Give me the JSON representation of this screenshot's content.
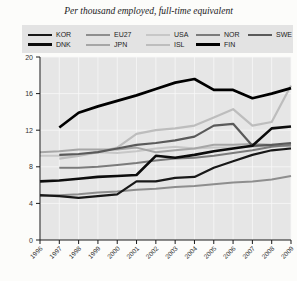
{
  "chart_data": {
    "type": "line",
    "title": "Per thousand employed, full-time equivalent",
    "xlabel": "",
    "ylabel": "",
    "x": [
      1996,
      1997,
      1998,
      1999,
      2000,
      2001,
      2002,
      2003,
      2004,
      2005,
      2006,
      2007,
      2008,
      2009
    ],
    "ylim": [
      0,
      20
    ],
    "yticks": [
      0,
      4,
      8,
      12,
      16,
      20
    ],
    "grid": true,
    "legend_position": "top",
    "legend_rows": [
      [
        "KOR",
        "EU27",
        "USA",
        "NOR",
        "SWE"
      ],
      [
        "DNK",
        "JPN",
        "ISL",
        "FIN"
      ]
    ],
    "colors": {
      "plot_background": "#e6e6e6",
      "legend_background": "#e3e3e3",
      "gridline": "#f7f7f7",
      "axis": "#1a1a1a"
    },
    "series": [
      {
        "name": "USA",
        "color": "#c7c7c7",
        "width": 2,
        "values": [
          9.2,
          9.2,
          9.3,
          9.6,
          9.5,
          9.7,
          10.0,
          10.2,
          10.0,
          10.1,
          10.1,
          10.2,
          10.3,
          10.4
        ]
      },
      {
        "name": "ISL",
        "color": "#bdbdbd",
        "width": 2.2,
        "values": [
          null,
          8.9,
          9.2,
          9.6,
          10.1,
          11.6,
          12.0,
          12.2,
          12.5,
          13.4,
          14.3,
          12.5,
          12.9,
          16.9
        ]
      },
      {
        "name": "JPN",
        "color": "#a6a6a6",
        "width": 2,
        "values": [
          9.6,
          9.7,
          9.9,
          9.9,
          9.9,
          10.1,
          9.6,
          9.8,
          10.0,
          10.4,
          10.4,
          10.5,
          10.4,
          10.2
        ]
      },
      {
        "name": "EU27",
        "color": "#8e8e8e",
        "width": 2,
        "values": [
          4.8,
          4.9,
          5.0,
          5.2,
          5.3,
          5.5,
          5.6,
          5.8,
          5.9,
          6.1,
          6.3,
          6.4,
          6.6,
          7.0
        ]
      },
      {
        "name": "NOR",
        "color": "#7b7b7b",
        "width": 2,
        "values": [
          null,
          7.9,
          7.9,
          8.0,
          8.2,
          8.4,
          8.7,
          8.9,
          9.0,
          9.2,
          9.5,
          9.8,
          10.2,
          10.4
        ]
      },
      {
        "name": "SWE",
        "color": "#5a5a5a",
        "width": 2.2,
        "values": [
          null,
          9.3,
          9.4,
          9.6,
          10.0,
          10.4,
          10.6,
          10.9,
          11.3,
          12.5,
          12.7,
          10.3,
          10.4,
          10.6
        ]
      },
      {
        "name": "KOR",
        "color": "#181818",
        "width": 2.2,
        "values": [
          4.9,
          4.8,
          4.6,
          4.8,
          5.0,
          6.4,
          6.4,
          6.8,
          6.9,
          7.9,
          8.6,
          9.3,
          9.8,
          10.0
        ]
      },
      {
        "name": "DNK",
        "color": "#0c0c0c",
        "width": 2.6,
        "values": [
          6.4,
          6.5,
          6.7,
          6.9,
          7.0,
          7.1,
          9.2,
          9.0,
          9.3,
          9.7,
          10.0,
          10.3,
          12.2,
          12.4
        ]
      },
      {
        "name": "FIN",
        "color": "#000000",
        "width": 2.7,
        "values": [
          null,
          12.3,
          13.9,
          14.6,
          15.2,
          15.8,
          16.5,
          17.2,
          17.6,
          16.4,
          16.4,
          15.5,
          16.0,
          16.6
        ]
      }
    ]
  }
}
